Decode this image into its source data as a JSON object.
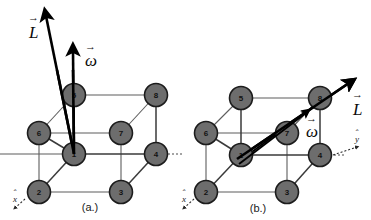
{
  "figure": {
    "background_color": "#ffffff",
    "node_fill_color": "#6d6d6d",
    "node_stroke_color": "#1c1c1c",
    "vector_color": "#000000"
  },
  "panels": [
    {
      "id": "a",
      "caption": "(a.)",
      "nodes": [
        {
          "label": "5",
          "cx": 74,
          "cy": 95
        },
        {
          "label": "8",
          "cx": 156,
          "cy": 95
        },
        {
          "label": "6",
          "cx": 39,
          "cy": 133
        },
        {
          "label": "7",
          "cx": 121,
          "cy": 133
        },
        {
          "label": "1",
          "cx": 74,
          "cy": 154
        },
        {
          "label": "4",
          "cx": 156,
          "cy": 154
        },
        {
          "label": "2",
          "cx": 39,
          "cy": 192
        },
        {
          "label": "3",
          "cx": 121,
          "cy": 192
        }
      ],
      "vectors": [
        {
          "name": "L",
          "symbol": "L",
          "label": "L⃗",
          "direction": "up-left-tilted",
          "tail_x": 74,
          "tail_y": 154,
          "head_x": 44,
          "head_y": 10
        },
        {
          "name": "omega",
          "symbol": "ω",
          "label": "ω⃗",
          "direction": "vertical-up",
          "tail_x": 74,
          "tail_y": 154,
          "head_x": 73,
          "head_y": 46
        }
      ],
      "axes": [
        {
          "name": "x-hat",
          "label": "x̂",
          "direction": "down-left"
        }
      ]
    },
    {
      "id": "b",
      "caption": "(b.)",
      "nodes": [
        {
          "label": "5",
          "cx": 241,
          "cy": 98
        },
        {
          "label": "8",
          "cx": 320,
          "cy": 98
        },
        {
          "label": "6",
          "cx": 206,
          "cy": 133
        },
        {
          "label": "7",
          "cx": 287,
          "cy": 133
        },
        {
          "label": "1",
          "cx": 241,
          "cy": 155
        },
        {
          "label": "4",
          "cx": 320,
          "cy": 155
        },
        {
          "label": "2",
          "cx": 206,
          "cy": 192
        },
        {
          "label": "3",
          "cx": 287,
          "cy": 192
        }
      ],
      "vectors": [
        {
          "name": "L",
          "symbol": "L",
          "label": "L⃗",
          "direction": "up-right-diagonal",
          "tail_x": 237,
          "tail_y": 158,
          "head_x": 352,
          "head_y": 80
        },
        {
          "name": "omega",
          "symbol": "ω",
          "label": "ω⃗",
          "direction": "up-right-diagonal",
          "tail_x": 237,
          "tail_y": 158,
          "head_x": 312,
          "head_y": 107
        }
      ],
      "axes": [
        {
          "name": "x-hat",
          "label": "x̂",
          "direction": "down-left"
        },
        {
          "name": "y-hat",
          "label": "ŷ",
          "direction": "right"
        }
      ]
    }
  ],
  "labels": {
    "vec_L": "L",
    "vec_omega": "ω",
    "axis_x": "x",
    "axis_y": "y",
    "caption_a": "(a.)",
    "caption_b": "(b.)",
    "n1": "1",
    "n2": "2",
    "n3": "3",
    "n4": "4",
    "n5": "5",
    "n6": "6",
    "n7": "7",
    "n8": "8"
  }
}
